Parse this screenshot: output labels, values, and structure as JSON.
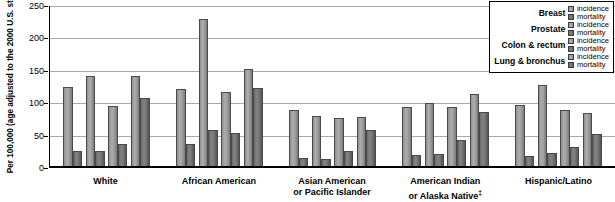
{
  "chart_data": {
    "type": "bar",
    "title": "",
    "xlabel": "",
    "ylabel": "Per 100,000 (age adjusted to the 2000 U.S. standard population)",
    "ylim": [
      0,
      250
    ],
    "yticks": [
      0,
      50,
      100,
      150,
      200,
      250
    ],
    "grid": true,
    "legend_position": "top-right",
    "categories": [
      "White",
      "African American",
      "Asian American or Pacific Islander",
      "American Indian or Alaska Native‡",
      "Hispanic/Latino"
    ],
    "series": [
      {
        "name": "Breast incidence",
        "cancer": "Breast",
        "measure": "incidence",
        "values": [
          124,
          120,
          88,
          92,
          96
        ]
      },
      {
        "name": "Breast mortality",
        "cancer": "Breast",
        "measure": "mortality",
        "values": [
          24,
          34,
          12,
          17,
          16
        ]
      },
      {
        "name": "Prostate incidence",
        "cancer": "Prostate",
        "measure": "incidence",
        "values": [
          141,
          230,
          78,
          98,
          127
        ]
      },
      {
        "name": "Prostate mortality",
        "cancer": "Prostate",
        "measure": "mortality",
        "values": [
          23,
          57,
          11,
          19,
          21
        ]
      },
      {
        "name": "Colon & rectum incidence",
        "cancer": "Colon & rectum",
        "measure": "incidence",
        "values": [
          93,
          115,
          75,
          92,
          88
        ]
      },
      {
        "name": "Colon & rectum mortality",
        "cancer": "Colon & rectum",
        "measure": "mortality",
        "values": [
          34,
          52,
          23,
          40,
          29
        ]
      },
      {
        "name": "Lung & bronchus incidence",
        "cancer": "Lung & bronchus",
        "measure": "incidence",
        "values": [
          140,
          152,
          76,
          112,
          83
        ]
      },
      {
        "name": "Lung & bronchus mortality",
        "cancer": "Lung & bronchus",
        "measure": "mortality",
        "values": [
          106,
          122,
          57,
          84,
          50
        ]
      }
    ]
  },
  "axis": {
    "y_title": "Per 100,000 (age adjusted to the 2000 U.S. standard population)",
    "tick_labels": [
      "250",
      "200",
      "150",
      "100",
      "50",
      "0"
    ]
  },
  "x_categories": [
    {
      "line1": "White",
      "line2": ""
    },
    {
      "line1": "African American",
      "line2": ""
    },
    {
      "line1": "Asian American",
      "line2": "or Pacific Islander"
    },
    {
      "line1": "American Indian",
      "line2": "or Alaska Native",
      "marker": "‡"
    },
    {
      "line1": "Hispanic/Latino",
      "line2": ""
    }
  ],
  "legend": {
    "rows": [
      {
        "name": "Breast",
        "incidence": "incidence",
        "mortality": "mortality"
      },
      {
        "name": "Prostate",
        "incidence": "incidence",
        "mortality": "mortality"
      },
      {
        "name": "Colon & rectum",
        "incidence": "incidence",
        "mortality": "mortality"
      },
      {
        "name": "Lung & bronchus",
        "incidence": "incidence",
        "mortality": "mortality"
      }
    ]
  },
  "colors": {
    "incidence": "#a0a0a0",
    "mortality": "#6e6e6e",
    "gridline": "#a8a8a8",
    "axis": "#000000"
  }
}
